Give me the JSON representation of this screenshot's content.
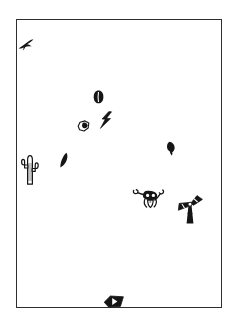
{
  "page": {
    "background_color": "#ffffff",
    "width": 237,
    "height": 326
  },
  "panel": {
    "name": "bordered-panel",
    "border_color": "#2e2e33",
    "fill_color": "#ffffff",
    "x": 16,
    "y": 19,
    "width": 206,
    "height": 289
  },
  "ink_color": "#1a1a1a",
  "motifs": [
    {
      "id": "bird",
      "label": "bird",
      "icon": "bird-icon",
      "x": 16,
      "y": 37,
      "width": 18,
      "height": 14,
      "fill": "#151515"
    },
    {
      "id": "seed",
      "label": "seed",
      "icon": "seed-icon",
      "x": 92,
      "y": 89,
      "width": 11,
      "height": 14,
      "fill": "#151515"
    },
    {
      "id": "lightning",
      "label": "lightning bolt",
      "icon": "lightning-bolt-icon",
      "x": 98,
      "y": 110,
      "width": 14,
      "height": 18,
      "fill": "#151515"
    },
    {
      "id": "pebble",
      "label": "pebble",
      "icon": "pebble-icon",
      "x": 76,
      "y": 119,
      "width": 13,
      "height": 12,
      "fill": "#151515"
    },
    {
      "id": "cactus",
      "label": "saguaro cactus",
      "icon": "cactus-icon",
      "x": 18,
      "y": 150,
      "width": 22,
      "height": 34,
      "fill": "#151515"
    },
    {
      "id": "sprout",
      "label": "sprout",
      "icon": "sprout-icon",
      "x": 58,
      "y": 151,
      "width": 10,
      "height": 16,
      "fill": "#151515"
    },
    {
      "id": "bud",
      "label": "bud",
      "icon": "bud-icon",
      "x": 165,
      "y": 140,
      "width": 10,
      "height": 15,
      "fill": "#151515"
    },
    {
      "id": "skull",
      "label": "steer skull",
      "icon": "steer-skull-icon",
      "x": 131,
      "y": 184,
      "width": 33,
      "height": 25,
      "fill": "#151515"
    },
    {
      "id": "windmill",
      "label": "windmill",
      "icon": "windmill-icon",
      "x": 176,
      "y": 194,
      "width": 28,
      "height": 29,
      "fill": "#151515"
    },
    {
      "id": "arrowhead",
      "label": "arrowhead",
      "icon": "arrowhead-icon",
      "x": 102,
      "y": 294,
      "width": 22,
      "height": 13,
      "fill": "#151515"
    }
  ]
}
